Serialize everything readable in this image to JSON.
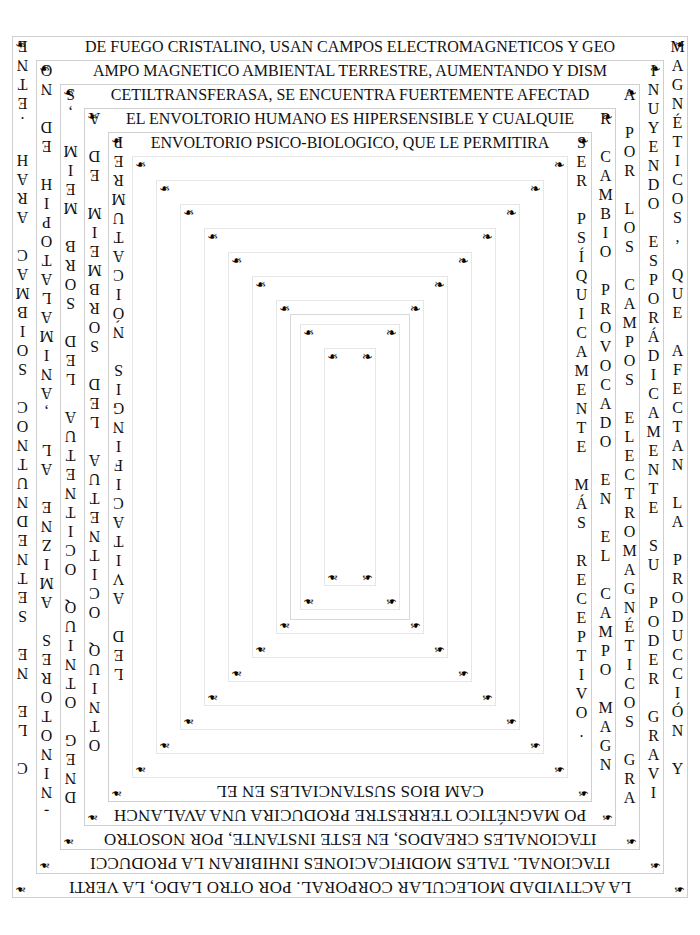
{
  "document": {
    "title": "Spiral Boustrophedon Text Plate",
    "language": "es",
    "page_background": "#ffffff",
    "ink_color": "#111111",
    "rule_color": "#cfcfcf",
    "corner_glyph": "❧",
    "corner_glyph_name": "rotated-floral-heart-bullet"
  },
  "spiral": {
    "reading_order": "outermost ring first, clockwise, spiralling inward",
    "ring_count": 16,
    "rings": [
      {
        "index": 0,
        "top": "DE FUEGO CRISTALINO, USAN CAMPOS ELECTROMAGNETICOS Y GEO",
        "right": "MAGNÉTICOS, QUE AFECTAN LA PRODUCCIÓN Y",
        "bottom": "LA ACTIVIDAD MOLECULAR CORPORAL. POR OTRO LADO, LA VERTI",
        "left": "ENTE. HARA CAMBIOS CONTUNDENTES EN EL C"
      },
      {
        "index": 1,
        "top": "AMPO MAGNETICO AMBIENTAL TERRESTRE,  AUMENTANDO Y DISM",
        "right": "INUYENDO ESPORÁDICAMENTE SU PODER GRAVI",
        "bottom": "ITACIONAL. TALES MODIFICACIONES INHIBIRAN LA PRODUCCI",
        "left": "ON DE HIPOTALAMINA, LA ENZIMA SEROTONIN-A-NI-A"
      },
      {
        "index": 2,
        "top": "CETILTRANSFERASA, SE ENCUENTRA FUERTEMENTE AFECTAD",
        "right": "A POR LOS CAMPOS ELECTROMAGNÉTICOS GRAVI",
        "bottom": "ITACIONALES CREADOS, EN ESTE INSTANTE, POR NOSOTRO",
        "left": "S, MIEM BROS DEL AUTENTICO QUINTO GENDOS LE .ERENDIFE DEFINITIVA"
      },
      {
        "index": 3,
        "top": "EL ENVOLTORIO HUMANO ES HIPERSENSIBLE Y CUALQUIE",
        "right": "R CAMBIO PROVOCADO EN EL CAMPO MAGNÉTI",
        "bottom": "PO MAGNÉTICO TERRESTRE PRODUCIRA UNA AVALANCH",
        "left": "A DE MIEMBROS DEL AUTENTICO QUINTO GENERA"
      },
      {
        "index": 4,
        "top": "ENVOLTORIO PSICO-BIOLOGICO, QUE LE PERMITIRA",
        "right": "SER PSÍQUICAMENTE MÁS RECEPTIVO.",
        "bottom": "CAM BIOS SUSTANCIALES EN EL",
        "left": "PERMUTACIÓN SIGNIFICATIVA DEL"
      },
      {
        "index": 5,
        "top": "",
        "right": "",
        "bottom": "",
        "left": ""
      },
      {
        "index": 6,
        "top": "",
        "right": "",
        "bottom": "",
        "left": ""
      },
      {
        "index": 7,
        "top": "",
        "right": "",
        "bottom": "",
        "left": ""
      },
      {
        "index": 8,
        "top": "",
        "right": "",
        "bottom": "",
        "left": ""
      },
      {
        "index": 9,
        "top": "",
        "right": "",
        "bottom": "",
        "left": ""
      },
      {
        "index": 10,
        "top": "",
        "right": "",
        "bottom": "",
        "left": ""
      },
      {
        "index": 11,
        "top": "",
        "right": "",
        "bottom": "",
        "left": ""
      },
      {
        "index": 12,
        "top": "",
        "right": "",
        "bottom": "",
        "left": ""
      },
      {
        "index": 13,
        "top": "",
        "right": "",
        "bottom": "",
        "left": ""
      },
      {
        "index": 14,
        "top": "",
        "right": "",
        "bottom": "",
        "left": ""
      },
      {
        "index": 15,
        "top": "",
        "right": "",
        "bottom": "",
        "left": ""
      }
    ]
  },
  "right_columns": [
    {
      "name": "right-col-1",
      "text": "MAGNÉTICOS, QUE AFECTAN LA PRODUCCIÓN Y"
    },
    {
      "name": "right-col-2",
      "text": "INUYENDO ESPORÁDICAMENTE SU PODER GRAVI"
    },
    {
      "name": "right-col-3",
      "text": "A POR LOS CAMPOS ELECTROMAGNÉTICOS GRAVI"
    },
    {
      "name": "right-col-4",
      "text": "R PERMUTACIÓN SIGNIFICATIVA DEL CAM"
    },
    {
      "name": "right-col-5",
      "text": "SER PSÍQUICAMENTE MÁS RECEPTIVO."
    }
  ],
  "left_columns": [
    {
      "name": "left-col-1",
      "text": "ENTE. HARA CAMBIOS CONTUNDENTES EN EL C"
    },
    {
      "name": "left-col-2",
      "text": "ON DE HIOM.T AL ENZIMA SEROTONIN-A-NI-A"
    },
    {
      "name": "left-col-3",
      "text": "S A MIEM DE NATURALES DEFINITIVA"
    },
    {
      "name": "left-col-4",
      "text": "S NO GENTE CIUDAD DE MIEM"
    }
  ],
  "bottom_rows": [
    {
      "name": "bottom-row-1",
      "text": "PO MAGNÉTICO TERRESTRE PRODUCIRA UNA AVALANCH"
    },
    {
      "name": "bottom-row-2",
      "text": "NDIVIDUALES CREADOS, EN ESTE INSTANTE, POR NOSOTRO"
    },
    {
      "name": "bottom-row-3",
      "text": "ITACIONAL, TALES MODIFICACIONES INHIBIRAN LA PRODUCCI"
    },
    {
      "name": "bottom-row-4",
      "text": "LA ACTIVIDAD MOLECULAR CORPORAL. POR OTRO LADO, LA VERTI"
    }
  ],
  "top_rows": [
    {
      "name": "top-row-1",
      "text": "DE FUEGO CRISTALINO, USAN CAMPOS ELECTROMAGNETICOS Y GEO"
    },
    {
      "name": "top-row-2",
      "text": "AMPO MAGNETICO AMBIENTAL TERRESTRE,  AUMENTANDO Y DISM"
    },
    {
      "name": "top-row-3",
      "text": "CETILTRANSFERASA, SE ENCUENTRA FUERTEMENTE AFECTAD"
    },
    {
      "name": "top-row-4",
      "text": "EL ENVOLTORIO HUMANO ES HIPERSENSIBLE Y CUALQUIE"
    },
    {
      "name": "top-row-5",
      "text": "ENVOLTORIO PSICO-BIOLOGICO, QUE LE PERMITIRA"
    }
  ],
  "geometry": {
    "outer_left": 12,
    "outer_top": 36,
    "outer_width": 676,
    "outer_height": 862,
    "ring_step_x": 24,
    "ring_step_y": 24,
    "strip": 19
  }
}
